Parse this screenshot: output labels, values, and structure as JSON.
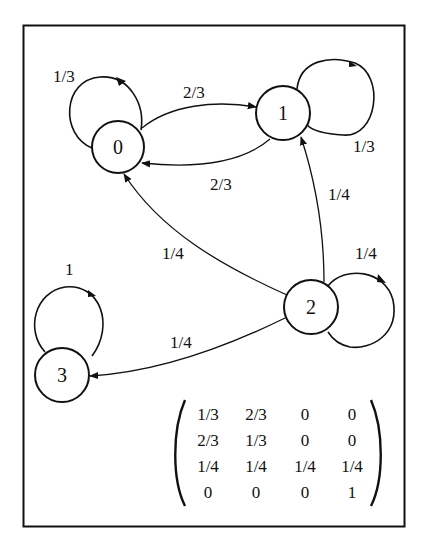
{
  "diagram": {
    "type": "markov-chain-state-diagram",
    "nodes": [
      {
        "id": "0",
        "label": "0"
      },
      {
        "id": "1",
        "label": "1"
      },
      {
        "id": "2",
        "label": "2"
      },
      {
        "id": "3",
        "label": "3"
      }
    ],
    "edges": [
      {
        "from": "0",
        "to": "0",
        "label": "1/3"
      },
      {
        "from": "0",
        "to": "1",
        "label": "2/3"
      },
      {
        "from": "1",
        "to": "0",
        "label": "2/3"
      },
      {
        "from": "1",
        "to": "1",
        "label": "1/3"
      },
      {
        "from": "2",
        "to": "1",
        "label": "1/4"
      },
      {
        "from": "2",
        "to": "0",
        "label": "1/4"
      },
      {
        "from": "2",
        "to": "2",
        "label": "1/4"
      },
      {
        "from": "2",
        "to": "3",
        "label": "1/4"
      },
      {
        "from": "3",
        "to": "3",
        "label": "1"
      }
    ],
    "matrix": {
      "rows": [
        [
          "1/3",
          "2/3",
          "0",
          "0"
        ],
        [
          "2/3",
          "1/3",
          "0",
          "0"
        ],
        [
          "1/4",
          "1/4",
          "1/4",
          "1/4"
        ],
        [
          "0",
          "0",
          "0",
          "1"
        ]
      ]
    }
  }
}
